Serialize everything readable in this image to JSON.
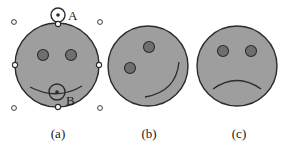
{
  "figure": {
    "background_color": "#ffffff",
    "face_fill": "#9e9e9e",
    "face_stroke": "#2b2b2b",
    "eye_fill": "#6f6f6f",
    "eye_stroke": "#2b2b2b",
    "mouth_stroke": "#2b2b2b",
    "handle_fill": "#ffffff",
    "handle_stroke": "#2b2b2b",
    "label_color": "#1a1a1a"
  },
  "panels": [
    {
      "id": "a",
      "caption": "(a)",
      "description": "selected face with handles, rotation pivot A and mouth control point B",
      "face": {
        "cx": 57,
        "cy": 65,
        "r": 42
      },
      "eyes": [
        {
          "cx": 43,
          "cy": 55,
          "r": 5.5
        },
        {
          "cx": 71,
          "cy": 55,
          "r": 5.5
        },
        {
          "cx": 43,
          "cy": 55,
          "r": 5.5
        }
      ],
      "mouth": "M 30 87 Q 57 101 82 86",
      "markers": [
        {
          "name": "rotation-pivot-A",
          "label": "A",
          "cx": 58,
          "cy": 15,
          "r": 7,
          "dot_r": 1.8,
          "label_x": 69,
          "label_y": 16
        },
        {
          "name": "mouth-control-B",
          "label": "B",
          "cx": 57,
          "cy": 92,
          "r": 8,
          "dot_r": 1.8,
          "label_x": 66,
          "label_y": 103
        }
      ],
      "rotation_stem": {
        "x1": 58,
        "y1": 22,
        "x2": 58,
        "y2": 24
      },
      "edge_handles": [
        {
          "name": "handle-top",
          "cx": 58,
          "cy": 24
        },
        {
          "name": "handle-left",
          "cx": 15,
          "cy": 65
        },
        {
          "name": "handle-right",
          "cx": 99,
          "cy": 65
        },
        {
          "name": "handle-bottom",
          "cx": 58,
          "cy": 107
        }
      ],
      "corner_handles": [
        {
          "name": "corner-handle-top-left",
          "cx": 14,
          "cy": 22
        },
        {
          "name": "corner-handle-top-right",
          "cx": 100,
          "cy": 22
        },
        {
          "name": "corner-handle-bottom-left",
          "cx": 14,
          "cy": 108
        },
        {
          "name": "corner-handle-bottom-right",
          "cx": 100,
          "cy": 108
        }
      ]
    },
    {
      "id": "b",
      "caption": "(b)",
      "description": "face rotated counter-clockwise",
      "face": {
        "cx": 148,
        "cy": 66,
        "r": 40
      },
      "eyes": [
        {
          "cx": 130,
          "cy": 68,
          "r": 5.5
        },
        {
          "cx": 149,
          "cy": 47,
          "r": 5.5
        }
      ],
      "mouth": "M 145 97 Q 176 92 179 62"
    },
    {
      "id": "c",
      "caption": "(c)",
      "description": "frowning face",
      "face": {
        "cx": 237,
        "cy": 66,
        "r": 40
      },
      "eyes": [
        {
          "cx": 223,
          "cy": 51,
          "r": 5.5
        },
        {
          "cx": 251,
          "cy": 51,
          "r": 5.5
        }
      ],
      "mouth": "M 213 89 Q 237 72 261 89"
    }
  ]
}
